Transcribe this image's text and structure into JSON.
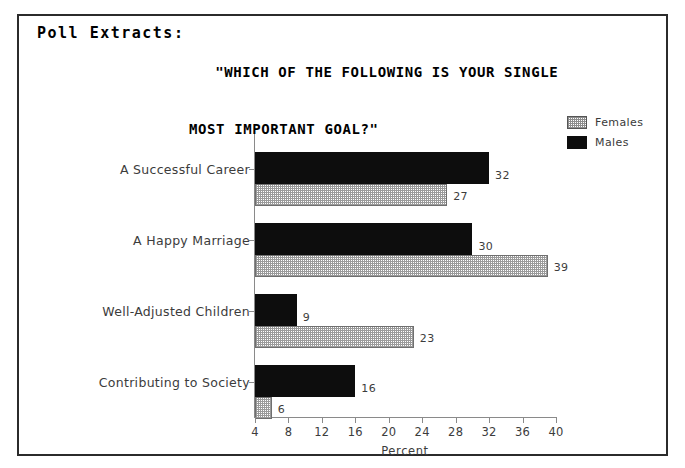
{
  "panel": {
    "header_label": "Poll Extracts:"
  },
  "chart_title": {
    "line1": "\"WHICH OF THE FOLLOWING IS YOUR SINGLE",
    "line2": "MOST IMPORTANT GOAL?\""
  },
  "legend": {
    "position": "top-right",
    "items": [
      {
        "label": "Females",
        "swatch": "dotted-gray-pattern",
        "color": "#9a9a9a"
      },
      {
        "label": "Males",
        "swatch": "solid-black",
        "color": "#0d0d0d"
      }
    ]
  },
  "chart_data": {
    "type": "bar",
    "orientation": "horizontal",
    "title": "\"WHICH OF THE FOLLOWING IS YOUR SINGLE MOST IMPORTANT GOAL?\"",
    "categories": [
      "A Successful Career",
      "A Happy Marriage",
      "Well-Adjusted Children",
      "Contributing to Society"
    ],
    "series": [
      {
        "name": "Males",
        "values": [
          32,
          30,
          9,
          16
        ],
        "color": "#0d0d0d"
      },
      {
        "name": "Females",
        "values": [
          27,
          39,
          23,
          6
        ],
        "color": "#9a9a9a"
      }
    ],
    "xlabel": "Percent",
    "ylabel": "",
    "xlim": [
      4,
      40
    ],
    "xticks": [
      4,
      8,
      12,
      16,
      20,
      24,
      28,
      32,
      36,
      40
    ],
    "grid": false,
    "data_labels": true
  }
}
